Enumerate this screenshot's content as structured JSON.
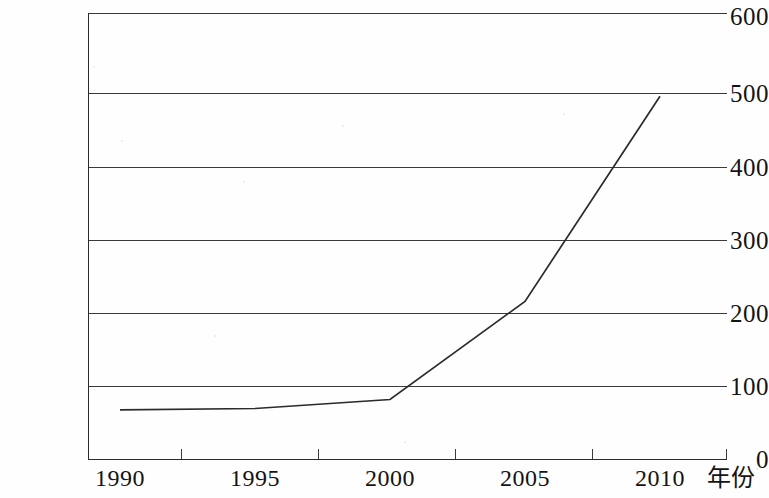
{
  "chart_data": {
    "type": "line",
    "title": "",
    "xlabel": "年份",
    "ylabel": "",
    "x": [
      1990,
      1995,
      2000,
      2005,
      2010
    ],
    "categories": [
      "1990",
      "1995",
      "2000",
      "2005",
      "2010"
    ],
    "values": [
      66,
      68,
      80,
      212,
      488
    ],
    "series": [
      {
        "name": "",
        "values": [
          66,
          68,
          80,
          212,
          488
        ]
      }
    ],
    "ylim": [
      0,
      600
    ],
    "xlim": [
      1990,
      2010
    ],
    "y_ticks": [
      0,
      100,
      200,
      300,
      400,
      500,
      600
    ],
    "y_tick_labels": [
      "0",
      "100",
      "200",
      "300",
      "400",
      "500",
      "600"
    ],
    "x_tick_labels": [
      "1990",
      "1995",
      "2000",
      "2005",
      "2010"
    ],
    "grid": "horizontal",
    "legend": "none",
    "line_color": "#2b2b2b",
    "background_color": "#ffffff"
  },
  "axes": {
    "y": {
      "ticks": [
        {
          "label": "600",
          "value": 600
        },
        {
          "label": "500",
          "value": 500
        },
        {
          "label": "400",
          "value": 400
        },
        {
          "label": "300",
          "value": 300
        },
        {
          "label": "200",
          "value": 200
        },
        {
          "label": "100",
          "value": 100
        },
        {
          "label": "0",
          "value": 0
        }
      ]
    },
    "x": {
      "ticks": [
        {
          "label": "1990",
          "value": 1990
        },
        {
          "label": "1995",
          "value": 1995
        },
        {
          "label": "2000",
          "value": 2000
        },
        {
          "label": "2005",
          "value": 2005
        },
        {
          "label": "2010",
          "value": 2010
        }
      ],
      "title": "年份"
    }
  }
}
